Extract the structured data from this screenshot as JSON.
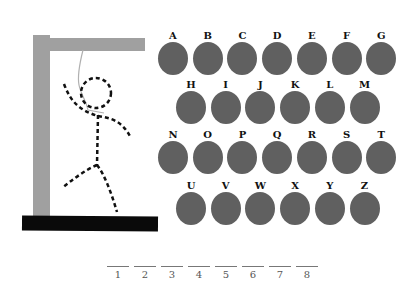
{
  "game": {
    "title": "Hangman",
    "colors": {
      "disc": "#606060",
      "gallows": "#a0a0a0",
      "base": "#0a0a0a",
      "rope": "#b0b0b0"
    }
  },
  "letters": {
    "row1": [
      "A",
      "B",
      "C",
      "D",
      "E",
      "F",
      "G"
    ],
    "row2": [
      "H",
      "I",
      "J",
      "K",
      "L",
      "M"
    ],
    "row3": [
      "N",
      "O",
      "P",
      "Q",
      "R",
      "S",
      "T"
    ],
    "row4": [
      "U",
      "V",
      "W",
      "X",
      "Y",
      "Z"
    ]
  },
  "word_slots": [
    "1",
    "2",
    "3",
    "4",
    "5",
    "6",
    "7",
    "8"
  ],
  "hangman_parts_shown": [
    "head",
    "body",
    "left-arm",
    "right-arm",
    "left-leg",
    "right-leg"
  ]
}
